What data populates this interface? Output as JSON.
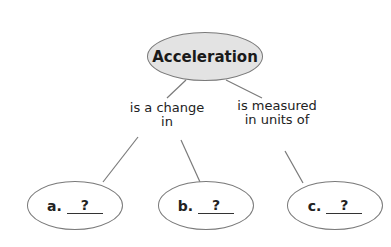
{
  "diagram": {
    "type": "concept-map",
    "root": {
      "label": "Acceleration"
    },
    "links": [
      {
        "label_line1": "is a change",
        "label_line2": "in"
      },
      {
        "label_line1": "is measured",
        "label_line2": "in units of"
      }
    ],
    "leaves": [
      {
        "letter": "a.",
        "answer": "?"
      },
      {
        "letter": "b.",
        "answer": "?"
      },
      {
        "letter": "c.",
        "answer": "?"
      }
    ],
    "colors": {
      "root_fill": "#e3e3e3",
      "stroke": "#7a7a7a",
      "text": "#222222"
    }
  }
}
